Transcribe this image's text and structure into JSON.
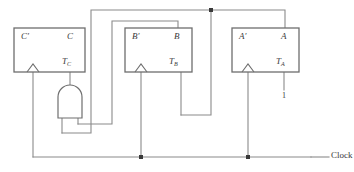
{
  "diagram": {
    "type": "logic-circuit-schematic",
    "colors": {
      "wire": "#8a8a8a",
      "box_border": "#6e6e6e",
      "text": "#3a3a3a",
      "junction": "#3a3a3a",
      "background": "#ffffff"
    },
    "flipflops": [
      {
        "id": "ff-c",
        "output_inverted_label": "C",
        "output_inverted_prime": "′",
        "output_label": "C",
        "input_label": "T",
        "input_subscript": "C",
        "box": {
          "x": 14,
          "y": 28,
          "w": 71,
          "h": 44
        }
      },
      {
        "id": "ff-b",
        "output_inverted_label": "B",
        "output_inverted_prime": "′",
        "output_label": "B",
        "input_label": "T",
        "input_subscript": "B",
        "box": {
          "x": 125,
          "y": 28,
          "w": 67,
          "h": 44
        }
      },
      {
        "id": "ff-a",
        "output_inverted_label": "A",
        "output_inverted_prime": "′",
        "output_label": "A",
        "input_label": "T",
        "input_subscript": "A",
        "box": {
          "x": 232,
          "y": 28,
          "w": 67,
          "h": 44
        }
      }
    ],
    "and_gate": {
      "id": "and-gate-1",
      "inputs": 2,
      "orientation": "output-up",
      "body": {
        "x": 58,
        "y": 85,
        "w": 24,
        "h": 33
      }
    },
    "constant_input": {
      "label": "1",
      "x": 284,
      "y": 97
    },
    "clock": {
      "label": "Clock",
      "line_y": 157,
      "label_x": 316,
      "junctions": [
        {
          "x": 141,
          "y": 157
        },
        {
          "x": 248,
          "y": 157
        }
      ]
    },
    "top_junction": {
      "x": 211,
      "y": 10
    }
  }
}
